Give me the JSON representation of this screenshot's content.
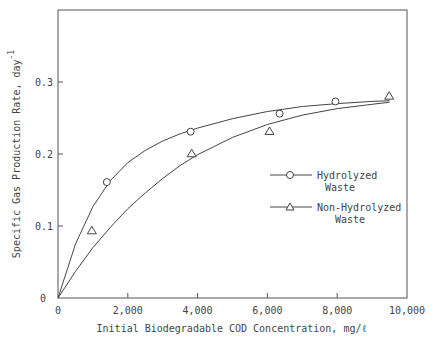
{
  "chart_data": {
    "type": "scatter",
    "title": "",
    "xlabel": "Initial Biodegradable COD Concentration, mg/ℓ",
    "ylabel": "Specific Gas Production Rate, day",
    "ylabel_superscript": "-1",
    "xlim": [
      0,
      10000
    ],
    "ylim": [
      0,
      0.37
    ],
    "x_ticks": [
      0,
      2000,
      4000,
      6000,
      8000,
      10000
    ],
    "x_tick_labels": [
      "0",
      "2,000",
      "4,000",
      "6,000",
      "8,000",
      "10,000"
    ],
    "y_ticks": [
      0,
      0.1,
      0.2,
      0.3
    ],
    "y_tick_labels": [
      "0",
      "0.1",
      "0.2",
      "0.3"
    ],
    "grid": false,
    "legend_position": "center-right",
    "series": [
      {
        "name": "Hydrolyzed Waste",
        "legend_lines": [
          "Hydrolyzed",
          "Waste"
        ],
        "marker": "circle",
        "points": [
          {
            "x": 0,
            "y": 0
          },
          {
            "x": 1400,
            "y": 0.161
          },
          {
            "x": 3800,
            "y": 0.231
          },
          {
            "x": 6350,
            "y": 0.256
          },
          {
            "x": 7950,
            "y": 0.273
          }
        ],
        "fit_curve": [
          [
            0,
            0
          ],
          [
            500,
            0.075
          ],
          [
            1000,
            0.127
          ],
          [
            1500,
            0.163
          ],
          [
            2000,
            0.188
          ],
          [
            2500,
            0.205
          ],
          [
            3000,
            0.218
          ],
          [
            3500,
            0.228
          ],
          [
            4000,
            0.236
          ],
          [
            5000,
            0.249
          ],
          [
            6000,
            0.259
          ],
          [
            7000,
            0.266
          ],
          [
            8000,
            0.27
          ],
          [
            9000,
            0.273
          ],
          [
            9500,
            0.274
          ]
        ]
      },
      {
        "name": "Non-Hydrolyzed Waste",
        "legend_lines": [
          "Non-Hydrolyzed",
          "Waste"
        ],
        "marker": "triangle",
        "points": [
          {
            "x": 0,
            "y": 0
          },
          {
            "x": 970,
            "y": 0.094
          },
          {
            "x": 3830,
            "y": 0.201
          },
          {
            "x": 6060,
            "y": 0.232
          },
          {
            "x": 9490,
            "y": 0.281
          }
        ],
        "fit_curve": [
          [
            0,
            0
          ],
          [
            500,
            0.037
          ],
          [
            1000,
            0.07
          ],
          [
            1500,
            0.098
          ],
          [
            2000,
            0.124
          ],
          [
            2500,
            0.146
          ],
          [
            3000,
            0.166
          ],
          [
            3500,
            0.184
          ],
          [
            4000,
            0.199
          ],
          [
            5000,
            0.223
          ],
          [
            6000,
            0.241
          ],
          [
            7000,
            0.254
          ],
          [
            8000,
            0.263
          ],
          [
            9000,
            0.269
          ],
          [
            9500,
            0.272
          ]
        ]
      }
    ]
  }
}
